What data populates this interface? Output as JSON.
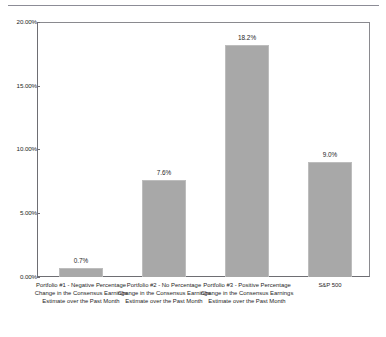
{
  "chart_data": {
    "type": "bar",
    "title": "",
    "subtitle": "",
    "xlabel": "",
    "ylabel": "",
    "ylim": [
      0,
      20
    ],
    "ytick_labels": [
      "20.00%",
      "15.00%",
      "10.00%",
      "5.00%",
      "0.00%"
    ],
    "ytick_values": [
      20,
      15,
      10,
      5,
      0
    ],
    "grid": false,
    "legend": "none",
    "categories": [
      "Portfolio #1 - Negative Percentage Change in the Consensus Earnings Estimate over the Past Month",
      "Portfolio #2 - No Percentage Change in the Consensus Earnings Estimate over the Past Month",
      "Portfolio #3 - Positive Percentage Change in the Consensus Earnings Estimate over the Past Month",
      "S&P 500"
    ],
    "values": [
      0.7,
      7.6,
      18.2,
      9.0
    ],
    "data_labels": [
      "0.7%",
      "7.6%",
      "18.2%",
      "9.0%"
    ],
    "bar_color": "#a8a8a8",
    "axis_color": "#6e6e73",
    "text_color": "#262626"
  }
}
